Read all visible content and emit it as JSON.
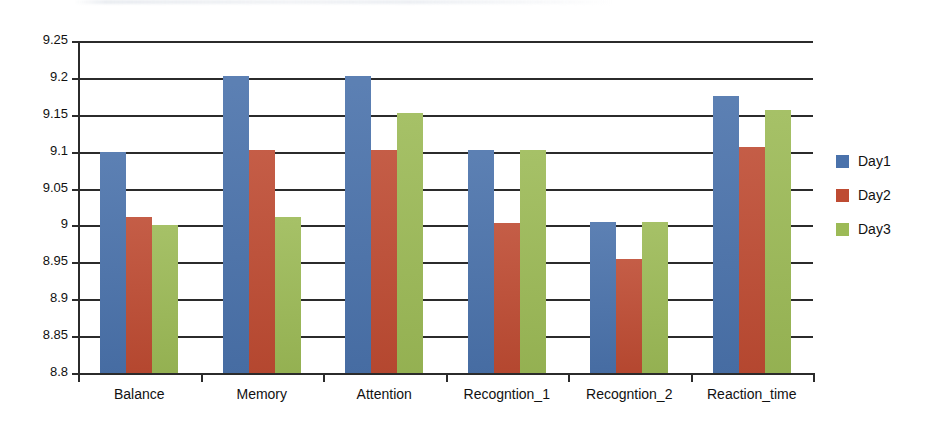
{
  "chart_data": {
    "type": "bar",
    "title": "",
    "xlabel": "",
    "ylabel": "",
    "ylim": [
      8.8,
      9.25
    ],
    "ytick_step": 0.05,
    "grid": true,
    "legend_position": "right",
    "categories": [
      "Balance",
      "Memory",
      "Attention",
      "Recogntion_1",
      "Recogntion_2",
      "Reaction_time"
    ],
    "ytick_labels": [
      "9.25",
      "9.2",
      "9.15",
      "9.1",
      "9.05",
      "9",
      "8.95",
      "8.9",
      "8.85",
      "8.8"
    ],
    "ytick_values": [
      9.25,
      9.2,
      9.15,
      9.1,
      9.05,
      9.0,
      8.95,
      8.9,
      8.85,
      8.8
    ],
    "series": [
      {
        "name": "Day1",
        "color": "#4a72ab",
        "values": [
          9.1,
          9.203,
          9.203,
          9.102,
          9.005,
          9.176
        ]
      },
      {
        "name": "Day2",
        "color": "#be4b32",
        "values": [
          9.011,
          9.102,
          9.102,
          9.004,
          8.955,
          9.106
        ]
      },
      {
        "name": "Day3",
        "color": "#9cba56",
        "values": [
          9.0,
          9.012,
          9.153,
          9.102,
          9.005,
          9.156
        ]
      }
    ]
  },
  "legend": {
    "items": [
      {
        "label": "Day1",
        "color": "#4a72ab"
      },
      {
        "label": "Day2",
        "color": "#be4b32"
      },
      {
        "label": "Day3",
        "color": "#9cba56"
      }
    ]
  }
}
